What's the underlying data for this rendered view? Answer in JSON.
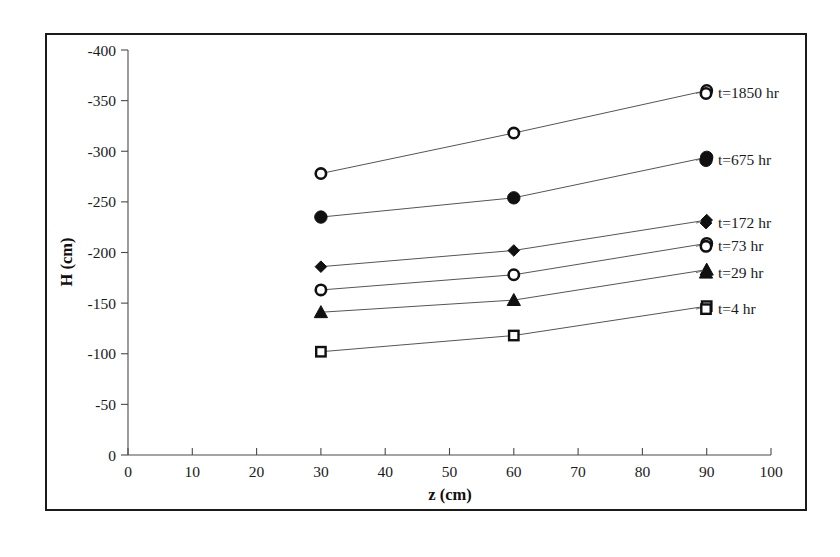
{
  "chart_data": {
    "type": "line",
    "title": "",
    "xlabel": "z (cm)",
    "ylabel": "H (cm)",
    "xlim": [
      0,
      100
    ],
    "ylim": [
      -400,
      0
    ],
    "x_ticks": [
      0,
      10,
      20,
      30,
      40,
      50,
      60,
      70,
      80,
      90,
      100
    ],
    "x_tick_labels": [
      "0",
      "10",
      "20",
      "30",
      "40",
      "50",
      "60",
      "70",
      "80",
      "90",
      "100"
    ],
    "y_ticks": [
      -400,
      -350,
      -300,
      -250,
      -200,
      -150,
      -100,
      -50,
      0
    ],
    "y_tick_labels": [
      "-400",
      "-350",
      "-300",
      "-250",
      "-200",
      "-150",
      "-100",
      "-50",
      "0"
    ],
    "grid": false,
    "legend_position": "right-inline-annotations",
    "x": [
      30,
      60,
      90
    ],
    "series": [
      {
        "name": "t=1850 hr",
        "marker": "open-circle",
        "values": [
          -278,
          -318,
          -360
        ],
        "label": "t=1850 hr",
        "label_y": -362
      },
      {
        "name": "t=675 hr",
        "marker": "filled-circle",
        "values": [
          -235,
          -254,
          -294
        ],
        "label": "t=675 hr",
        "label_y": -296
      },
      {
        "name": "t=172 hr",
        "marker": "filled-diamond",
        "values": [
          -186,
          -202,
          -232
        ],
        "label": "t=172 hr",
        "label_y": -234
      },
      {
        "name": "t=73 hr",
        "marker": "open-circle",
        "values": [
          -163,
          -178,
          -209
        ],
        "label": "t=73 hr",
        "label_y": -211
      },
      {
        "name": "t=29 hr",
        "marker": "filled-triangle",
        "values": [
          -141,
          -153,
          -183
        ],
        "label": "t=29 hr",
        "label_y": -185
      },
      {
        "name": "t=4 hr",
        "marker": "open-square",
        "values": [
          -102,
          -118,
          -147
        ],
        "label": "t=4 hr",
        "label_y": -149
      }
    ],
    "colors": {
      "marker": "#101010",
      "line": "#555555",
      "axis": "#4a4a4a",
      "text": "#1a1a1a",
      "background": "#ffffff",
      "frame": "#1a1a1a"
    }
  }
}
